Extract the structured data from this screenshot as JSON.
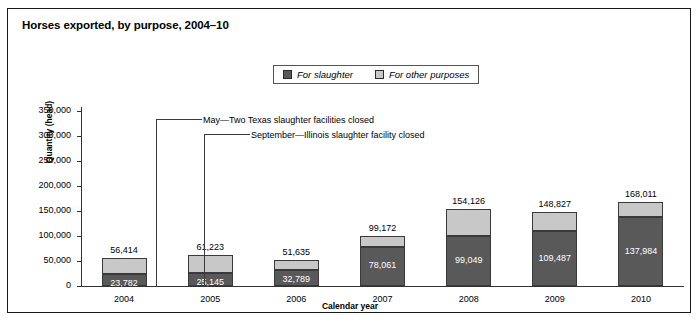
{
  "figure": {
    "title": "Horses exported, by purpose, 2004–10"
  },
  "legend": {
    "items": [
      {
        "label": "For slaughter",
        "color": "#595959",
        "swatch": "dark-gray-swatch"
      },
      {
        "label": "For other purposes",
        "color": "#c8c8c8",
        "swatch": "light-gray-swatch"
      }
    ]
  },
  "annotations": [
    {
      "text": "May—Two Texas slaughter facilities closed"
    },
    {
      "text": "September—Illinois slaughter facility closed"
    }
  ],
  "chart_data": {
    "type": "bar",
    "subtype": "stacked",
    "title": "Horses exported, by purpose, 2004–10",
    "xlabel": "Calendar year",
    "ylabel": "Quantity (head)",
    "categories": [
      "2004",
      "2005",
      "2006",
      "2007",
      "2008",
      "2009",
      "2010"
    ],
    "ylim": [
      0,
      350000
    ],
    "ytick_labels": [
      "0",
      "50,000",
      "100,000",
      "150,000",
      "200,000",
      "250,000",
      "300,000",
      "350,000"
    ],
    "ytick_values": [
      0,
      50000,
      100000,
      150000,
      200000,
      250000,
      300000,
      350000
    ],
    "grid": false,
    "legend_position": "top-center",
    "series": [
      {
        "name": "For slaughter",
        "color": "#595959",
        "values": [
          23782,
          25145,
          32789,
          78061,
          99049,
          109487,
          137984
        ],
        "labels": [
          "23,782",
          "25,145",
          "32,789",
          "78,061",
          "99,049",
          "109,487",
          "137,984"
        ]
      },
      {
        "name": "For other purposes",
        "color": "#c8c8c8",
        "values": [
          32632,
          36078,
          18846,
          21111,
          55077,
          39340,
          30027
        ],
        "labels": [
          "",
          "",
          "",
          "",
          "",
          "",
          ""
        ]
      }
    ],
    "totals": [
      56414,
      61223,
      51635,
      99172,
      154126,
      148827,
      168011
    ],
    "total_labels": [
      "56,414",
      "61,223",
      "51,635",
      "99,172",
      "154,126",
      "148,827",
      "168,011"
    ],
    "annotations": [
      {
        "text": "May—Two Texas slaughter facilities closed",
        "category": "2007"
      },
      {
        "text": "September—Illinois slaughter facility closed",
        "category": "2007"
      }
    ]
  }
}
